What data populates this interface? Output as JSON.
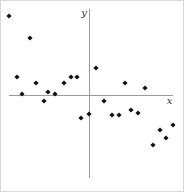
{
  "figure": {
    "background": "#ffffff",
    "border_color": "#d9d9d9",
    "width": 184,
    "height": 192
  },
  "chart_data": {
    "type": "scatter",
    "title": "",
    "xlabel": "x",
    "ylabel": "y",
    "legend": "none",
    "grid": false,
    "tick_labels": "none (abstract axes, no numeric scale)",
    "point_shape": "filled-diamond",
    "point_color": "#111111",
    "point_half_size": 2.6,
    "axis_color": "#9a9a9a",
    "axis_stroke_width": 1,
    "coordinate_system": "screen pixels of 184x192 canvas; axes cross at origin (88, 94); y increases downward on screen",
    "origin": {
      "x": 88.5,
      "y": 94.5
    },
    "axes": {
      "x_axis": {
        "y": 94.5,
        "x1": 8,
        "x2": 172,
        "label": "x",
        "label_x": 168.5,
        "label_y": 103
      },
      "y_axis": {
        "x": 88.5,
        "y1": 8,
        "y2": 177,
        "label": "y",
        "label_x": 83,
        "label_y": 15
      }
    },
    "points": [
      {
        "x": 8,
        "y": 15
      },
      {
        "x": 29,
        "y": 37
      },
      {
        "x": 16,
        "y": 76
      },
      {
        "x": 35,
        "y": 82
      },
      {
        "x": 63,
        "y": 82
      },
      {
        "x": 70,
        "y": 76
      },
      {
        "x": 76,
        "y": 76
      },
      {
        "x": 21,
        "y": 93
      },
      {
        "x": 47,
        "y": 91
      },
      {
        "x": 54,
        "y": 93
      },
      {
        "x": 95,
        "y": 67
      },
      {
        "x": 124,
        "y": 82
      },
      {
        "x": 144,
        "y": 87
      },
      {
        "x": 43,
        "y": 100
      },
      {
        "x": 80,
        "y": 117
      },
      {
        "x": 88,
        "y": 113
      },
      {
        "x": 103,
        "y": 100
      },
      {
        "x": 111,
        "y": 114
      },
      {
        "x": 118,
        "y": 114
      },
      {
        "x": 130,
        "y": 109
      },
      {
        "x": 137,
        "y": 112
      },
      {
        "x": 159,
        "y": 129
      },
      {
        "x": 172,
        "y": 124
      },
      {
        "x": 165,
        "y": 137
      },
      {
        "x": 152,
        "y": 144
      }
    ],
    "annotation": "scatter plot with negative correlation trend, points in all four quadrants"
  }
}
